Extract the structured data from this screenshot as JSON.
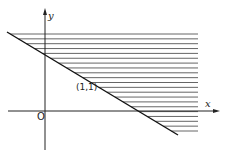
{
  "figure": {
    "axis_x_label": "x",
    "axis_y_label": "y",
    "origin_label": "O",
    "point_label": "(1,1)",
    "line": {
      "description": "boundary line x + y = 2",
      "from": [
        7,
        32
      ],
      "to": [
        178,
        135
      ]
    },
    "shading": {
      "description": "horizontal hatching above the line",
      "top": 34,
      "bottom": 135,
      "right": 198,
      "spacing": 4.85
    },
    "colors": {
      "ink": "#222222",
      "hatch": "#555555",
      "background": "#ffffff"
    }
  }
}
